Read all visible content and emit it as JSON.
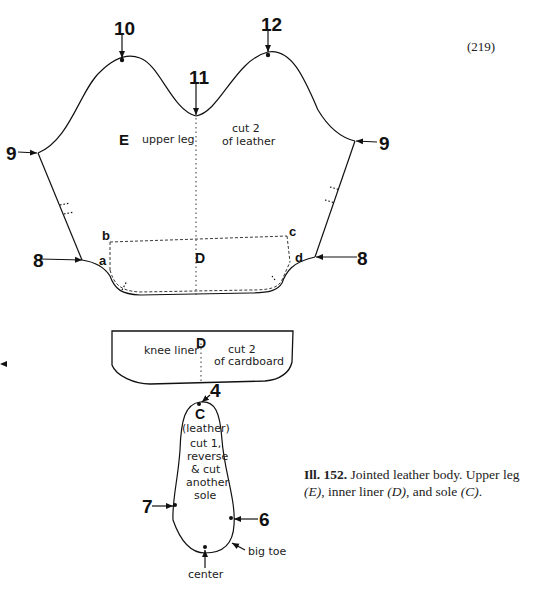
{
  "page_number": "(219)",
  "pieces": {
    "upper_leg": {
      "letter": "E",
      "name": "upper leg",
      "instruction_line1": "cut 2",
      "instruction_line2": "of leather",
      "center_letter": "D",
      "points": {
        "p10": "10",
        "p11": "11",
        "p12": "12",
        "p9_left": "9",
        "p9_right": "9",
        "p8_left": "8",
        "p8_right": "8",
        "a": "a",
        "b": "b",
        "c": "c",
        "d": "d"
      }
    },
    "knee_liner": {
      "letter": "D",
      "name": "knee liner",
      "instruction_line1": "cut 2",
      "instruction_line2": "of cardboard"
    },
    "sole": {
      "letter": "C",
      "material": "(leather)",
      "instruction_lines": [
        "cut 1,",
        "reverse",
        "& cut",
        "another",
        "sole"
      ],
      "points": {
        "p4": "4",
        "p6": "6",
        "p7": "7"
      },
      "big_toe_label": "big toe",
      "center_label": "center"
    }
  },
  "caption": {
    "ill_label": "Ill. 152.",
    "text_part1": " Jointed leather body. Upper leg ",
    "e_ref": "(E)",
    "text_part2": ", inner liner ",
    "d_ref": "(D)",
    "text_part3": ", and sole ",
    "c_ref": "(C)",
    "text_part4": "."
  }
}
